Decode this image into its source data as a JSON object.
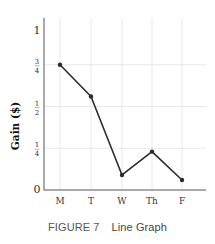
{
  "chart_data": {
    "type": "line",
    "title": "",
    "xlabel": "",
    "ylabel": "Gain ($)",
    "categories": [
      "M",
      "T",
      "W",
      "Th",
      "F"
    ],
    "series": [
      {
        "name": "Gain",
        "values": [
          0.75,
          0.56,
          0.09,
          0.23,
          0.06
        ]
      }
    ],
    "y_ticks": [
      {
        "value": 0,
        "num": "0",
        "den": ""
      },
      {
        "value": 0.25,
        "num": "1",
        "den": "4"
      },
      {
        "value": 0.5,
        "num": "1",
        "den": "2"
      },
      {
        "value": 0.75,
        "num": "3",
        "den": "4"
      },
      {
        "value": 1,
        "num": "1",
        "den": ""
      }
    ],
    "ylim": [
      0,
      1
    ],
    "grid": true,
    "legend": "none",
    "colors": {
      "line": "#2b2b2b",
      "grid": "#e3e3e3",
      "axis": "#555555"
    }
  },
  "caption": {
    "figure": "FIGURE 7",
    "text": "Line Graph"
  }
}
